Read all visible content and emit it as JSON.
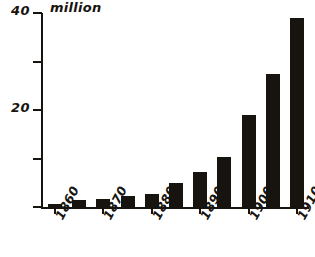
{
  "figure": {
    "unit_label": "million",
    "background_color": "#ffffff",
    "ink_color": "#17140f"
  },
  "chart_data": {
    "type": "bar",
    "title": "",
    "subtitle": "",
    "xlabel": "",
    "ylabel": "million",
    "ylim": [
      0,
      40
    ],
    "grid": false,
    "legend": null,
    "y_ticks": [
      {
        "value": 40,
        "label": "40"
      },
      {
        "value": 30,
        "label": ""
      },
      {
        "value": 20,
        "label": "20"
      },
      {
        "value": 10,
        "label": ""
      },
      {
        "value": 0,
        "label": ""
      }
    ],
    "x_tick_labels": [
      "1860",
      "1870",
      "1880",
      "1890",
      "1900",
      "1910"
    ],
    "categories": [
      "1860",
      "1865",
      "1870",
      "1875",
      "1880",
      "1885",
      "1890",
      "1895",
      "1900",
      "1905",
      "1910"
    ],
    "values": [
      0.6,
      1.4,
      1.6,
      2.2,
      2.6,
      5.0,
      7.3,
      10.4,
      19.0,
      27.5,
      39.0
    ],
    "bar_color": "#17140f",
    "bar_width_px": 14,
    "series": [
      {
        "name": "million",
        "values": [
          0.6,
          1.4,
          1.6,
          2.2,
          2.6,
          5.0,
          7.3,
          10.4,
          19.0,
          27.5,
          39.0
        ]
      }
    ]
  }
}
